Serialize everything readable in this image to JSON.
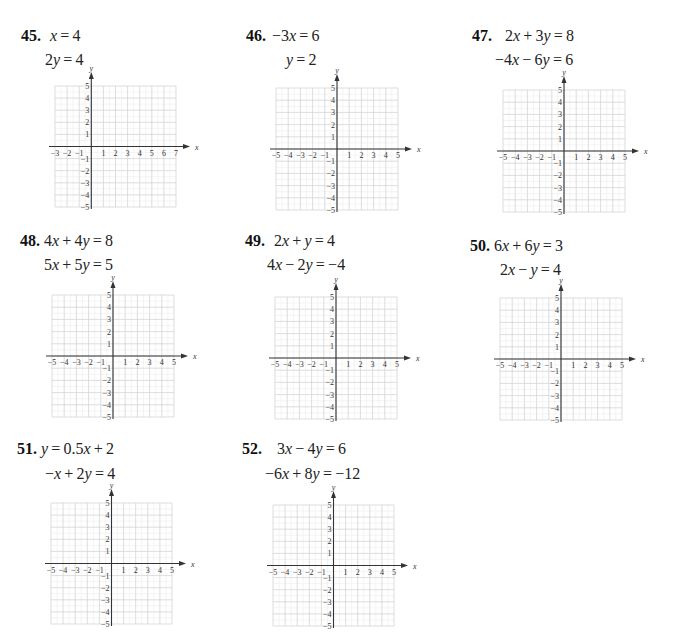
{
  "problems": [
    {
      "number": "45.",
      "eq1": "x = 4",
      "eq2": "2y = 4",
      "num_pos": [
        21,
        27
      ],
      "eq1_pos": [
        50,
        27
      ],
      "eq2_pos": [
        45,
        51
      ],
      "grid": {
        "left": 55,
        "top": 86,
        "cell": 12.1,
        "xmin": -3,
        "xmax": 7,
        "ymin": -5,
        "ymax": 5
      }
    },
    {
      "number": "46.",
      "eq1": "−3x = 6",
      "eq2": "y = 2",
      "num_pos": [
        246,
        27
      ],
      "eq1_pos": [
        272,
        27
      ],
      "eq2_pos": [
        286,
        51
      ],
      "grid": {
        "left": 276,
        "top": 88,
        "cell": 12.2,
        "xmin": -5,
        "xmax": 5,
        "ymin": -5,
        "ymax": 5
      }
    },
    {
      "number": "47.",
      "eq1": "2x + 3y = 8",
      "eq2": "−4x − 6y = 6",
      "num_pos": [
        472,
        27
      ],
      "eq1_pos": [
        505,
        27
      ],
      "eq2_pos": [
        495,
        51
      ],
      "grid": {
        "left": 503,
        "top": 90,
        "cell": 12.2,
        "xmin": -5,
        "xmax": 5,
        "ymin": -5,
        "ymax": 5
      }
    },
    {
      "number": "48.",
      "eq1": "4x + 4y = 8",
      "eq2": "5x + 5y = 5",
      "num_pos": [
        20,
        232
      ],
      "eq1_pos": [
        44,
        232
      ],
      "eq2_pos": [
        44,
        256
      ],
      "grid": {
        "left": 52,
        "top": 295,
        "cell": 12.2,
        "xmin": -5,
        "xmax": 5,
        "ymin": -5,
        "ymax": 5
      }
    },
    {
      "number": "49.",
      "eq1": "2x + y = 4",
      "eq2": "4x − 2y = −4",
      "num_pos": [
        245,
        232
      ],
      "eq1_pos": [
        274,
        232
      ],
      "eq2_pos": [
        267,
        256
      ],
      "grid": {
        "left": 275,
        "top": 297,
        "cell": 12.2,
        "xmin": -5,
        "xmax": 5,
        "ymin": -5,
        "ymax": 5
      }
    },
    {
      "number": "50.",
      "eq1": "6x + 6y = 3",
      "eq2": "2x − y = 4",
      "num_pos": [
        470,
        237
      ],
      "eq1_pos": [
        494,
        237
      ],
      "eq2_pos": [
        500,
        261
      ],
      "grid": {
        "left": 500,
        "top": 298,
        "cell": 12.2,
        "xmin": -5,
        "xmax": 5,
        "ymin": -5,
        "ymax": 5
      }
    },
    {
      "number": "51.",
      "eq1": "y = 0.5x + 2",
      "eq2": "−x + 2y = 4",
      "num_pos": [
        17,
        440
      ],
      "eq1_pos": [
        41,
        440
      ],
      "eq2_pos": [
        45,
        465
      ],
      "grid": {
        "left": 51,
        "top": 503,
        "cell": 12.1,
        "xmin": -5,
        "xmax": 5,
        "ymin": -5,
        "ymax": 5
      }
    },
    {
      "number": "52.",
      "eq1": "3x − 4y = 6",
      "eq2": "−6x + 8y = −12",
      "num_pos": [
        242,
        440
      ],
      "eq1_pos": [
        277,
        440
      ],
      "eq2_pos": [
        265,
        465
      ],
      "grid": {
        "left": 273,
        "top": 505,
        "cell": 12.1,
        "xmin": -5,
        "xmax": 5,
        "ymin": -5,
        "ymax": 5
      }
    }
  ],
  "axis_labels": {
    "x": "x",
    "y": "y"
  },
  "colors": {
    "grid_major": "#d4d4d4",
    "grid_minor": "#ececec",
    "axis": "#333333",
    "text": "#222222"
  },
  "chart_data": [
    {
      "type": "table",
      "title": "45.",
      "equations": [
        "x = 4",
        "2y = 4"
      ],
      "xlabel": "x",
      "ylabel": "y",
      "xlim": [
        -3,
        7
      ],
      "ylim": [
        -5,
        5
      ],
      "x_ticks": [
        -3,
        -2,
        -1,
        1,
        2,
        3,
        4,
        5,
        6,
        7
      ],
      "y_ticks": [
        -5,
        -4,
        -3,
        -2,
        -1,
        1,
        2,
        3,
        4,
        5
      ],
      "grid": true,
      "series": []
    },
    {
      "type": "table",
      "title": "46.",
      "equations": [
        "−3x = 6",
        "y = 2"
      ],
      "xlabel": "x",
      "ylabel": "y",
      "xlim": [
        -5,
        5
      ],
      "ylim": [
        -5,
        5
      ],
      "x_ticks": [
        -5,
        -4,
        -3,
        -2,
        -1,
        1,
        2,
        3,
        4,
        5
      ],
      "y_ticks": [
        -5,
        -4,
        -3,
        -2,
        -1,
        1,
        2,
        3,
        4,
        5
      ],
      "grid": true,
      "series": []
    },
    {
      "type": "table",
      "title": "47.",
      "equations": [
        "2x + 3y = 8",
        "−4x − 6y = 6"
      ],
      "xlabel": "x",
      "ylabel": "y",
      "xlim": [
        -5,
        5
      ],
      "ylim": [
        -5,
        5
      ],
      "x_ticks": [
        -5,
        -4,
        -3,
        -2,
        -1,
        1,
        2,
        3,
        4,
        5
      ],
      "y_ticks": [
        -5,
        -4,
        -3,
        -2,
        -1,
        1,
        2,
        3,
        4,
        5
      ],
      "grid": true,
      "series": []
    },
    {
      "type": "table",
      "title": "48.",
      "equations": [
        "4x + 4y = 8",
        "5x + 5y = 5"
      ],
      "xlabel": "x",
      "ylabel": "y",
      "xlim": [
        -5,
        5
      ],
      "ylim": [
        -5,
        5
      ],
      "x_ticks": [
        -5,
        -4,
        -3,
        -2,
        -1,
        1,
        2,
        3,
        4,
        5
      ],
      "y_ticks": [
        -5,
        -4,
        -3,
        -2,
        -1,
        1,
        2,
        3,
        4,
        5
      ],
      "grid": true,
      "series": []
    },
    {
      "type": "table",
      "title": "49.",
      "equations": [
        "2x + y = 4",
        "4x − 2y = −4"
      ],
      "xlabel": "x",
      "ylabel": "y",
      "xlim": [
        -5,
        5
      ],
      "ylim": [
        -5,
        5
      ],
      "x_ticks": [
        -5,
        -4,
        -3,
        -2,
        -1,
        1,
        2,
        3,
        4,
        5
      ],
      "y_ticks": [
        -5,
        -4,
        -3,
        -2,
        -1,
        1,
        2,
        3,
        4,
        5
      ],
      "grid": true,
      "series": []
    },
    {
      "type": "table",
      "title": "50.",
      "equations": [
        "6x + 6y = 3",
        "2x − y = 4"
      ],
      "xlabel": "x",
      "ylabel": "y",
      "xlim": [
        -5,
        5
      ],
      "ylim": [
        -5,
        5
      ],
      "x_ticks": [
        -5,
        -4,
        -3,
        -2,
        -1,
        1,
        2,
        3,
        4,
        5
      ],
      "y_ticks": [
        -5,
        -4,
        -3,
        -2,
        -1,
        1,
        2,
        3,
        4,
        5
      ],
      "grid": true,
      "series": []
    },
    {
      "type": "table",
      "title": "51.",
      "equations": [
        "y = 0.5x + 2",
        "−x + 2y = 4"
      ],
      "xlabel": "x",
      "ylabel": "y",
      "xlim": [
        -5,
        5
      ],
      "ylim": [
        -5,
        5
      ],
      "x_ticks": [
        -5,
        -4,
        -3,
        -2,
        -1,
        1,
        2,
        3,
        4,
        5
      ],
      "y_ticks": [
        -5,
        -4,
        -3,
        -2,
        -1,
        1,
        2,
        3,
        4,
        5
      ],
      "grid": true,
      "series": []
    },
    {
      "type": "table",
      "title": "52.",
      "equations": [
        "3x − 4y = 6",
        "−6x + 8y = −12"
      ],
      "xlabel": "x",
      "ylabel": "y",
      "xlim": [
        -5,
        5
      ],
      "ylim": [
        -5,
        5
      ],
      "x_ticks": [
        -5,
        -4,
        -3,
        -2,
        -1,
        1,
        2,
        3,
        4,
        5
      ],
      "y_ticks": [
        -5,
        -4,
        -3,
        -2,
        -1,
        1,
        2,
        3,
        4,
        5
      ],
      "grid": true,
      "series": []
    }
  ]
}
